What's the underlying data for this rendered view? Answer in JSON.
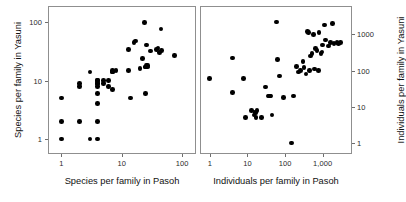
{
  "figure": {
    "background": "#ffffff",
    "point_color": "#000000",
    "frame_color": "#8f8f8f",
    "panel_count": 2
  },
  "chart_data": [
    {
      "type": "scatter",
      "panel": "left",
      "title": "",
      "xlabel": "Species per family in Pasoh",
      "ylabel": "Species per family in Yasuni",
      "xscale": "log",
      "yscale": "log",
      "grid": false,
      "legend": "none",
      "xticks": [
        1,
        10,
        100
      ],
      "xticklabels": [
        "1",
        "10",
        "100"
      ],
      "yticks": [
        1,
        10,
        100
      ],
      "yticklabels": [
        "1",
        "10",
        "100"
      ],
      "xlim": [
        0.6,
        170
      ],
      "ylim": [
        0.55,
        190
      ],
      "x": [
        1,
        1,
        1,
        2,
        2,
        2,
        3,
        3,
        4,
        4,
        4,
        4,
        4,
        4,
        4,
        4,
        4,
        5,
        5,
        6,
        6,
        7,
        7,
        7,
        7,
        8,
        13,
        13,
        14,
        16,
        17,
        20,
        22,
        24,
        25,
        25,
        25,
        26,
        26,
        27,
        27,
        30,
        38,
        40,
        42,
        45,
        46,
        75
      ],
      "y": [
        1,
        2,
        5,
        2,
        8,
        9,
        1,
        14,
        1,
        4,
        6,
        8,
        9,
        9,
        10,
        10,
        2,
        9,
        10,
        8,
        10,
        7,
        14,
        14,
        15,
        15,
        15,
        34,
        5,
        45,
        48,
        16,
        24,
        100,
        6,
        17,
        17,
        18,
        41,
        17,
        18,
        32,
        34,
        36,
        30,
        76,
        33,
        27
      ]
    },
    {
      "type": "scatter",
      "panel": "right",
      "title": "",
      "xlabel": "Individuals per family in Pasoh",
      "ylabel": "Individuals per family in Yasuni",
      "xscale": "log",
      "yscale": "log",
      "grid": false,
      "legend": "none",
      "xticks": [
        1,
        10,
        100,
        1000
      ],
      "xticklabels": [
        "1",
        "10",
        "100",
        "1,000"
      ],
      "yticks": [
        1,
        10,
        100,
        1000
      ],
      "yticklabels": [
        "1",
        "10",
        "100",
        "1000"
      ],
      "xlim": [
        0.55,
        6000
      ],
      "ylim": [
        0.5,
        6000
      ],
      "x": [
        1,
        4,
        4,
        8,
        9,
        13,
        15,
        16,
        17,
        17,
        18,
        24,
        30,
        35,
        38,
        40,
        42,
        45,
        60,
        62,
        70,
        90,
        150,
        170,
        200,
        230,
        260,
        300,
        320,
        360,
        400,
        420,
        450,
        480,
        520,
        560,
        600,
        650,
        700,
        760,
        800,
        900,
        950,
        1000,
        1100,
        1200,
        1400,
        1600,
        1800,
        2000,
        2400,
        2600,
        3000
      ],
      "y": [
        60,
        25,
        220,
        60,
        5,
        8,
        6,
        7,
        7,
        5,
        8,
        5,
        35,
        20,
        20,
        20,
        20,
        6,
        2200,
        200,
        70,
        18,
        1,
        20,
        130,
        90,
        100,
        180,
        120,
        80,
        1200,
        1100,
        100,
        250,
        300,
        1000,
        110,
        400,
        350,
        100,
        1100,
        300,
        320,
        500,
        1800,
        700,
        480,
        600,
        2000,
        550,
        600,
        560,
        600
      ]
    }
  ]
}
